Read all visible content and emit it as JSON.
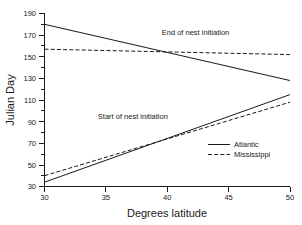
{
  "chart_data": {
    "type": "line",
    "title": "",
    "xlabel": "Degrees latitude",
    "ylabel": "Julian Day",
    "xlim": [
      30,
      50
    ],
    "ylim": [
      30,
      190
    ],
    "xticks": [
      30,
      35,
      40,
      45,
      50
    ],
    "yticks": [
      30,
      50,
      70,
      90,
      110,
      130,
      150,
      170,
      190
    ],
    "grid": false,
    "legend_position": "center-right",
    "legend": [
      {
        "name": "Atlantic",
        "style": "solid"
      },
      {
        "name": "Mississippi",
        "style": "dashed"
      }
    ],
    "annotations": [
      {
        "text": "End of nest initiation",
        "x": 42.3,
        "y": 170
      },
      {
        "text": "Start of nest initiation",
        "x": 37.2,
        "y": 92
      }
    ],
    "series": [
      {
        "name": "Atlantic end of nest initiation",
        "group": "End of nest initiation",
        "population": "Atlantic",
        "style": "solid",
        "x": [
          30,
          50
        ],
        "values": [
          180,
          128
        ]
      },
      {
        "name": "Mississippi end of nest initiation",
        "group": "End of nest initiation",
        "population": "Mississippi",
        "style": "dashed",
        "x": [
          30,
          50
        ],
        "values": [
          157,
          152
        ]
      },
      {
        "name": "Atlantic start of nest initiation",
        "group": "Start of nest initiation",
        "population": "Atlantic",
        "style": "solid",
        "x": [
          30,
          50
        ],
        "values": [
          34,
          115
        ]
      },
      {
        "name": "Mississippi start of nest initiation",
        "group": "Start of nest initiation",
        "population": "Mississippi",
        "style": "dashed",
        "x": [
          30,
          50
        ],
        "values": [
          40,
          108
        ]
      }
    ]
  }
}
